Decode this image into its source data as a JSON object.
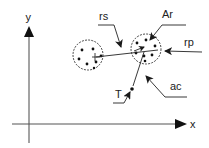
{
  "diagram": {
    "type": "vector-geometry",
    "colors": {
      "stroke": "#2a2a2a",
      "axis": "#555555",
      "fill_dot": "#111111",
      "background": "#ffffff"
    },
    "axes": {
      "x_label": "x",
      "y_label": "y"
    },
    "labels": {
      "rs": "rs",
      "ar": "Ar",
      "rp": "rp",
      "ac": "ac",
      "t": "T"
    },
    "nodes": [
      {
        "id": "left-cluster",
        "shape": "dashed-circle",
        "description": "cluster of particles with center marker"
      },
      {
        "id": "right-cluster",
        "shape": "dashed-circle",
        "description": "cluster of particles with center marker"
      },
      {
        "id": "target-point",
        "shape": "dot",
        "label": "T"
      }
    ],
    "annotations": [
      {
        "label": "rs",
        "points_to": "segment between clusters"
      },
      {
        "label": "Ar",
        "points_to": "right-cluster"
      },
      {
        "label": "rp",
        "points_to": "right-cluster edge"
      },
      {
        "label": "ac",
        "points_to": "vector toward target"
      },
      {
        "label": "T",
        "points_to": "target-point"
      }
    ]
  }
}
